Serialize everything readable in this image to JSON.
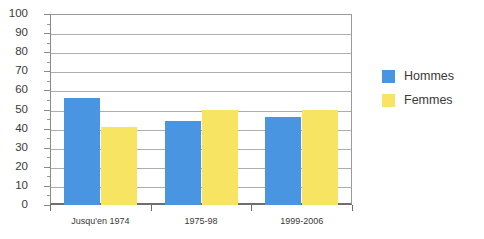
{
  "chart_data": {
    "type": "bar",
    "title": "",
    "subtitle": "",
    "xlabel": "",
    "ylabel": "",
    "categories": [
      "Jusqu'en 1974",
      "1975-98",
      "1999-2006"
    ],
    "series": [
      {
        "name": "Hommes",
        "color": "#4a95e2",
        "values": [
          56,
          44,
          46
        ]
      },
      {
        "name": "Femmes",
        "color": "#f7e463",
        "values": [
          41,
          50,
          50
        ]
      }
    ],
    "ylim": [
      0,
      100
    ],
    "yticks": [
      0,
      10,
      20,
      30,
      40,
      50,
      60,
      70,
      80,
      90,
      100
    ],
    "ytick_labels": [
      "0",
      "10",
      "20",
      "30",
      "40",
      "50",
      "60",
      "70",
      "80",
      "90",
      "100"
    ],
    "minor_ytick_step": 5,
    "grid": true,
    "grid_axis": "y",
    "legend_position": "right",
    "legend": [
      "Hommes",
      "Femmes"
    ],
    "annotations": []
  },
  "legend": {
    "items": [
      {
        "label": "Hommes",
        "swatch": "legend-swatch-hommes"
      },
      {
        "label": "Femmes",
        "swatch": "legend-swatch-femmes"
      }
    ]
  },
  "axis": {
    "y_labels": [
      "100",
      "90",
      "80",
      "70",
      "60",
      "50",
      "40",
      "30",
      "20",
      "10",
      "0"
    ],
    "x_labels": [
      "Jusqu'en 1974",
      "1975-98",
      "1999-2006"
    ]
  }
}
